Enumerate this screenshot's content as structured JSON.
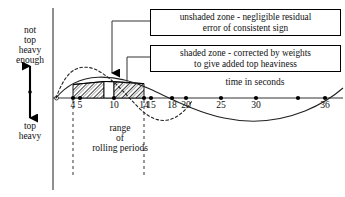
{
  "figure": {
    "type": "annotated-line-chart",
    "background": "#ffffff",
    "ink": "#000000"
  },
  "axes": {
    "y_label_top": "not\ntop\nheavy\nenough",
    "y_label_bottom": "top\nheavy",
    "x_label": "time in seconds",
    "origin_marker": "open-circle"
  },
  "callouts": [
    {
      "id": "unshaded",
      "line1": "unshaded zone - negligible residual",
      "line2": "error of consistent sign"
    },
    {
      "id": "shaded",
      "line1": "shaded zone - corrected by weights",
      "line2": "to give added top heaviness"
    }
  ],
  "annotations": {
    "range_label": "range\nof\nrolling periods"
  },
  "chart_data": {
    "type": "line",
    "title": "",
    "xlabel": "time in seconds",
    "ylabel": "",
    "xlim": [
      0,
      38
    ],
    "ylim": [
      -1.25,
      1.35
    ],
    "grid": false,
    "legend": "none",
    "tick_labels": [
      "4",
      "5",
      "10",
      "14",
      "15",
      "18",
      "20",
      "25",
      "30",
      "36"
    ],
    "tick_values": [
      4,
      5,
      10,
      14,
      15,
      18,
      20,
      25,
      30,
      36
    ],
    "series": [
      {
        "name": "solid curve",
        "style": "solid",
        "x": [
          0,
          2,
          4,
          5,
          7,
          10,
          12,
          14,
          15,
          18,
          20,
          22,
          25,
          28,
          30,
          33,
          36,
          38
        ],
        "y": [
          0.0,
          0.34,
          0.55,
          0.62,
          0.72,
          0.76,
          0.73,
          0.65,
          0.6,
          0.33,
          0.1,
          -0.13,
          -0.4,
          -0.54,
          -0.57,
          -0.44,
          -0.04,
          0.26
        ]
      },
      {
        "name": "dashed curve",
        "style": "dashed",
        "x": [
          0,
          2,
          4,
          5,
          7,
          10,
          12,
          14,
          15,
          17,
          19,
          21,
          23,
          25,
          26
        ],
        "y": [
          0.0,
          0.62,
          0.94,
          1.03,
          1.1,
          1.04,
          0.88,
          0.62,
          0.46,
          0.06,
          -0.33,
          -0.55,
          -0.58,
          -0.4,
          -0.22
        ]
      }
    ],
    "shaded_zones": [
      {
        "label": "shaded zone",
        "fill": "hatched",
        "x_from": 4,
        "x_to": 10.2
      },
      {
        "label": "unshaded zone",
        "fill": "none",
        "x_from": 10.2,
        "x_to": 12.1
      },
      {
        "label": "shaded zone",
        "fill": "hatched",
        "x_from": 12.1,
        "x_to": 14
      }
    ],
    "range_of_rolling_periods": {
      "from": 4,
      "to": 14
    }
  }
}
